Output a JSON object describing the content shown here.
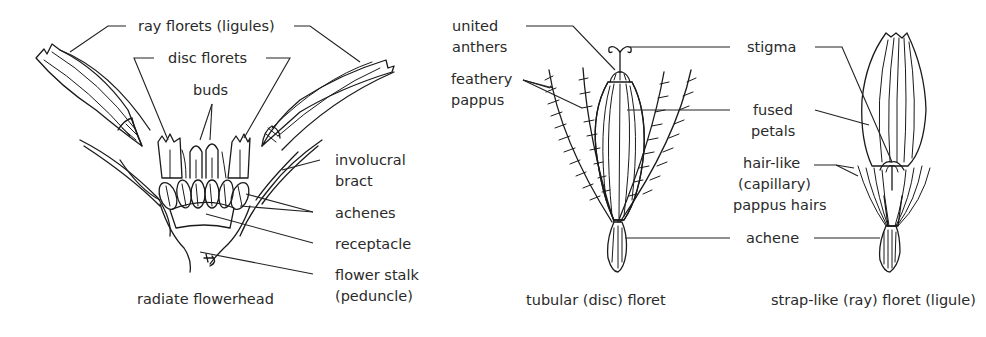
{
  "diagram": {
    "panels": [
      {
        "id": "radiate",
        "caption": "radiate flowerhead",
        "labels": [
          {
            "id": "ray-florets",
            "lines": [
              "ray florets (ligules)"
            ]
          },
          {
            "id": "disc-florets",
            "lines": [
              "disc florets"
            ]
          },
          {
            "id": "buds",
            "lines": [
              "buds"
            ]
          },
          {
            "id": "involucral-bract",
            "lines": [
              "involucral",
              "bract"
            ]
          },
          {
            "id": "achenes",
            "lines": [
              "achenes"
            ]
          },
          {
            "id": "receptacle",
            "lines": [
              "receptacle"
            ]
          },
          {
            "id": "flower-stalk",
            "lines": [
              "flower stalk",
              "(peduncle)"
            ]
          }
        ]
      },
      {
        "id": "tubular",
        "caption": "tubular (disc) floret",
        "labels": [
          {
            "id": "united-anthers",
            "lines": [
              "united",
              "anthers"
            ]
          },
          {
            "id": "feathery-pappus",
            "lines": [
              "feathery",
              "pappus"
            ]
          }
        ]
      },
      {
        "id": "shared",
        "labels": [
          {
            "id": "stigma",
            "lines": [
              "stigma"
            ]
          },
          {
            "id": "fused-petals",
            "lines": [
              "fused",
              "petals"
            ]
          },
          {
            "id": "capillary-pappus",
            "lines": [
              "hair-like",
              "(capillary)",
              "pappus hairs"
            ]
          },
          {
            "id": "achene",
            "lines": [
              "achene"
            ]
          }
        ]
      },
      {
        "id": "strap",
        "caption": "strap-like (ray) floret (ligule)"
      }
    ]
  }
}
